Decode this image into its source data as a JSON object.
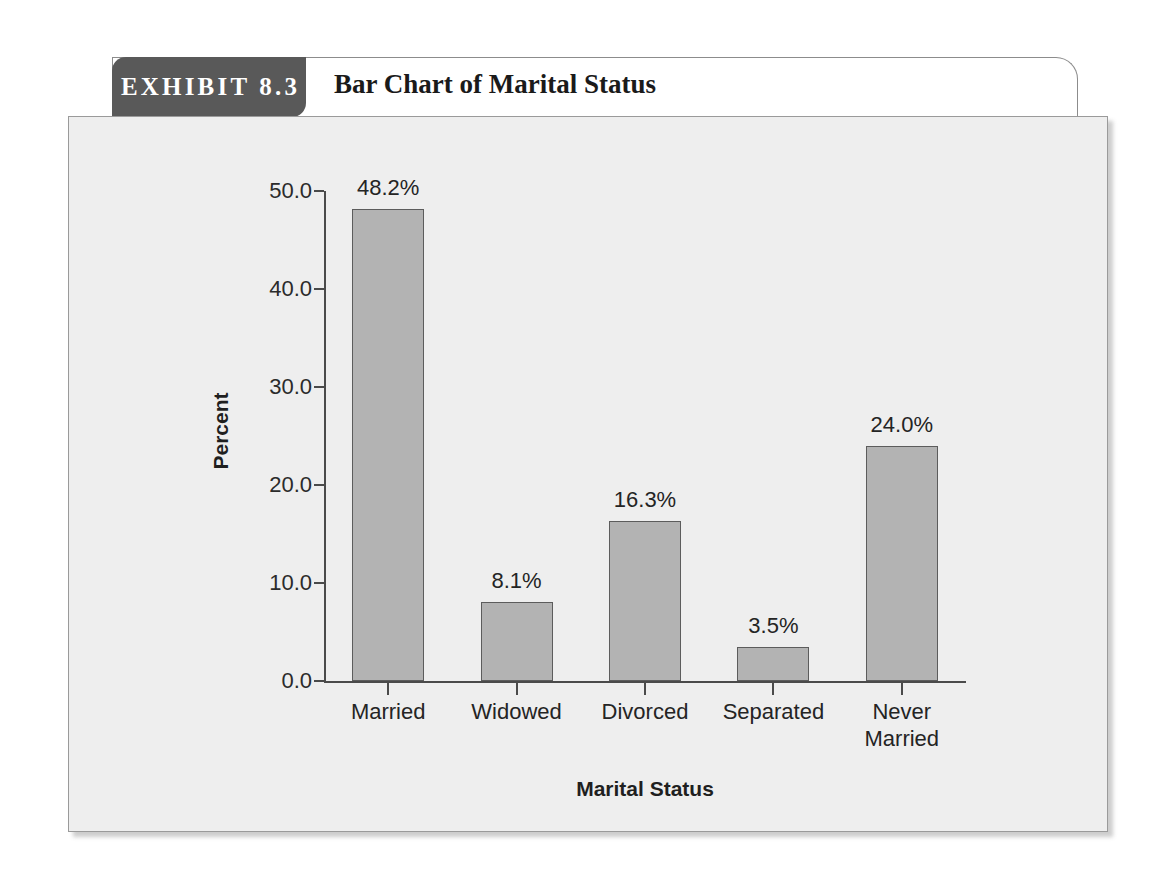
{
  "exhibit": {
    "tab_label": "EXHIBIT 8.3",
    "title": "Bar Chart of Marital Status"
  },
  "colors": {
    "tab_background": "#595959",
    "tab_text": "#ffffff",
    "panel_background": "#eeeeee",
    "panel_border": "#9a9a9a",
    "bar_fill": "#b3b3b3",
    "bar_border": "#5c5c5c",
    "axis": "#4a4a4a",
    "text": "#242424"
  },
  "chart_data": {
    "type": "bar",
    "title": "Bar Chart of Marital Status",
    "xlabel": "Marital Status",
    "ylabel": "Percent",
    "categories": [
      "Married",
      "Widowed",
      "Divorced",
      "Separated",
      "Never\nMarried"
    ],
    "values": [
      48.2,
      16.3,
      16.3,
      3.5,
      24.0
    ],
    "value_labels": [
      "48.2%",
      "8.1%",
      "16.3%",
      "3.5%",
      "24.0%"
    ],
    "bar_values": [
      48.2,
      8.1,
      16.3,
      3.5,
      24.0
    ],
    "ylim": [
      0.0,
      50.0
    ],
    "ytick_values": [
      0.0,
      10.0,
      20.0,
      30.0,
      40.0,
      50.0
    ],
    "ytick_labels": [
      "0.0",
      "10.0",
      "20.0",
      "30.0",
      "40.0",
      "50.0"
    ],
    "grid": false,
    "legend": null
  }
}
